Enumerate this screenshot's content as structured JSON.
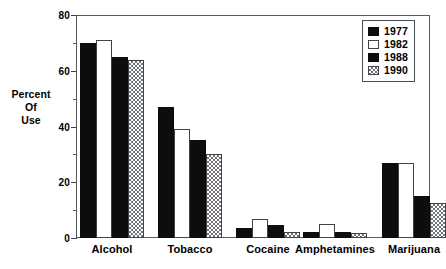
{
  "chart_data": {
    "type": "bar",
    "title": "",
    "xlabel": "",
    "ylabel": "Percent Of Use",
    "ylabel_lines": [
      "Percent",
      "Of",
      "Use"
    ],
    "ylim": [
      0,
      80
    ],
    "y_ticks": [
      0,
      20,
      40,
      60,
      80
    ],
    "y_tick_labels": [
      "0",
      "20",
      "40",
      "60",
      "80"
    ],
    "y_minor_ticks": [
      10,
      30,
      50,
      70
    ],
    "grid": false,
    "legend_position": "top-right",
    "categories": [
      "Alcohol",
      "Tobacco",
      "Cocaine",
      "Amphetamines",
      "Marijuana"
    ],
    "series": [
      {
        "name": "1977",
        "fill": "solid",
        "color": "#0d0d0d",
        "values": [
          70,
          47,
          3.5,
          2.3,
          27
        ]
      },
      {
        "name": "1982",
        "fill": "open",
        "color": "#ffffff",
        "values": [
          71,
          39,
          7.0,
          5.0,
          27
        ]
      },
      {
        "name": "1988",
        "fill": "solid",
        "color": "#0d0d0d",
        "values": [
          65,
          35,
          4.5,
          2.0,
          15
        ]
      },
      {
        "name": "1990",
        "fill": "hatch",
        "color": "#6f7378",
        "values": [
          64,
          30,
          2.0,
          1.8,
          12.5
        ]
      }
    ]
  },
  "legend": {
    "entries": [
      {
        "label": "1977",
        "fill": "solid"
      },
      {
        "label": "1982",
        "fill": "open"
      },
      {
        "label": "1988",
        "fill": "solid"
      },
      {
        "label": "1990",
        "fill": "hatch"
      }
    ]
  }
}
